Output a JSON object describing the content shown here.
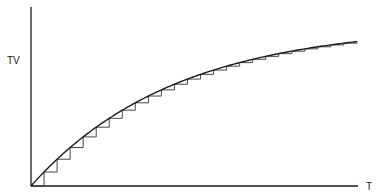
{
  "chart_data": {
    "type": "line",
    "title": "",
    "xlabel": "T",
    "ylabel": "TV",
    "grid": false,
    "legend": "none",
    "xlim": [
      0,
      25
    ],
    "ylim": [
      0,
      100
    ],
    "series": [
      {
        "name": "curve",
        "function": "TV = 100 * (1 - exp(-T / 11))",
        "x": [
          0,
          1,
          2,
          3,
          4,
          5,
          6,
          7,
          8,
          9,
          10,
          11,
          12,
          13,
          14,
          15,
          16,
          17,
          18,
          19,
          20,
          21,
          22,
          23,
          24,
          25
        ],
        "values": [
          0,
          8.7,
          16.6,
          23.8,
          30.5,
          36.5,
          42.0,
          47.0,
          51.7,
          55.9,
          59.7,
          63.2,
          66.4,
          69.3,
          72.0,
          74.3,
          76.6,
          78.6,
          80.5,
          82.1,
          83.8,
          85.2,
          86.5,
          87.7,
          88.8,
          89.7
        ]
      },
      {
        "name": "staircase",
        "style": "step",
        "steps": 25
      }
    ]
  },
  "labels": {
    "y_axis": "TV",
    "x_axis": "T"
  },
  "colors": {
    "ink": "#1a1a1a",
    "step_ink": "#333333",
    "background": "#ffffff"
  }
}
